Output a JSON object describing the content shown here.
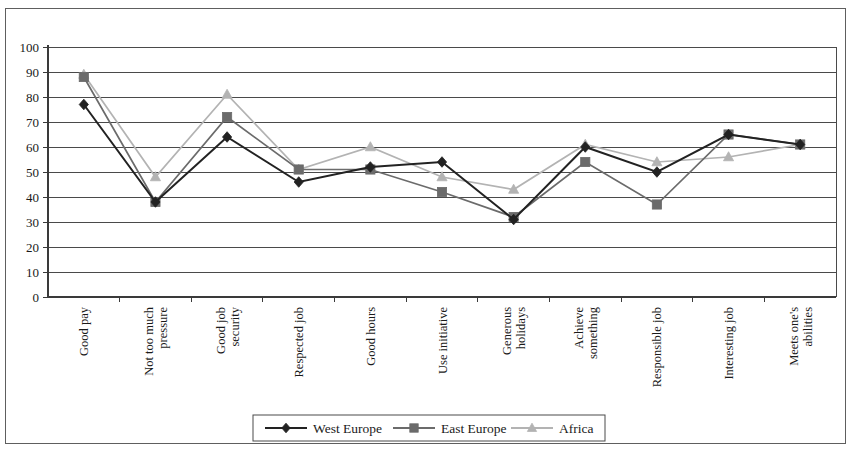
{
  "chart_data": {
    "type": "line",
    "title": "",
    "subtitle": "",
    "xlabel": "",
    "ylabel": "",
    "ylim": [
      0,
      100
    ],
    "ytick_step": 10,
    "yticks": [
      0,
      10,
      20,
      30,
      40,
      50,
      60,
      70,
      80,
      90,
      100
    ],
    "grid": true,
    "grid_axis": "y",
    "legend_position": "bottom",
    "categories": [
      "Good pay",
      "Not too much pressure",
      "Good job security",
      "Respected job",
      "Good hours",
      "Use initiative",
      "Generous holidays",
      "Achieve something",
      "Responsible job",
      "Interesting job",
      "Meets one's abilities"
    ],
    "category_lines": [
      [
        "Good pay"
      ],
      [
        "Not too much",
        "pressure"
      ],
      [
        "Good job",
        "security"
      ],
      [
        "Respected job"
      ],
      [
        "Good hours"
      ],
      [
        "Use initiative"
      ],
      [
        "Generous",
        "holidays"
      ],
      [
        "Achieve",
        "something"
      ],
      [
        "Responsible job"
      ],
      [
        "Interesting job"
      ],
      [
        "Meets one's",
        "abilities"
      ]
    ],
    "series": [
      {
        "name": "West Europe",
        "marker": "diamond",
        "color": "#222222",
        "values": [
          77,
          38,
          64,
          46,
          52,
          54,
          31,
          60,
          50,
          65,
          61
        ]
      },
      {
        "name": "East Europe",
        "marker": "square",
        "color": "#6b6b6b",
        "values": [
          88,
          38,
          72,
          51,
          51,
          42,
          32,
          54,
          37,
          65,
          61
        ]
      },
      {
        "name": "Africa",
        "marker": "triangle",
        "color": "#b3b3b3",
        "values": [
          89,
          48,
          81,
          51,
          60,
          48,
          43,
          61,
          54,
          56,
          61
        ]
      }
    ]
  },
  "legend": {
    "entries": [
      {
        "label": "West Europe"
      },
      {
        "label": "East Europe"
      },
      {
        "label": "Africa"
      }
    ]
  }
}
